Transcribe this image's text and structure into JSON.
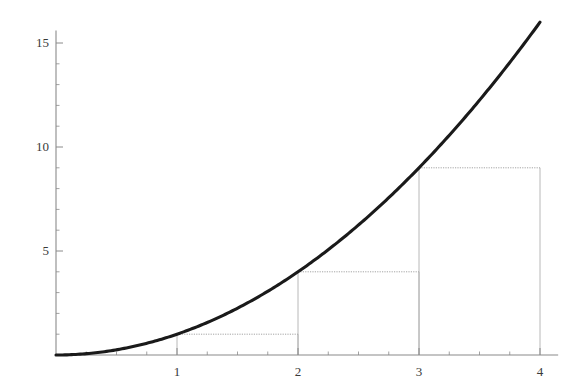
{
  "chart_data": {
    "type": "line",
    "title": "",
    "subtitle": "",
    "xlabel": "",
    "ylabel": "",
    "function": "y = x^2",
    "xlim": [
      0,
      4.15
    ],
    "ylim": [
      0,
      15.6
    ],
    "grid": false,
    "legend": null,
    "x_ticks_major": [
      1,
      2,
      3,
      4
    ],
    "x_tick_labels": [
      "1",
      "2",
      "3",
      "4"
    ],
    "x_ticks_minor_step": 0.25,
    "y_ticks_major": [
      5,
      10,
      15
    ],
    "y_tick_labels": [
      "5",
      "10",
      "15"
    ],
    "y_ticks_minor_step": 1,
    "series": [
      {
        "name": "y = x^2",
        "x": [
          0,
          0.2,
          0.4,
          0.6,
          0.8,
          1,
          1.2,
          1.4,
          1.6,
          1.8,
          2,
          2.2,
          2.4,
          2.6,
          2.8,
          3,
          3.2,
          3.4,
          3.6,
          3.8,
          4
        ],
        "values": [
          0,
          0.04,
          0.16,
          0.36,
          0.64,
          1,
          1.44,
          1.96,
          2.56,
          3.24,
          4,
          4.84,
          5.76,
          6.76,
          7.84,
          9,
          10.24,
          11.56,
          12.96,
          14.44,
          16
        ]
      }
    ],
    "rectangles": {
      "method": "left-endpoint Riemann sum",
      "width": 1,
      "items": [
        {
          "x0": 1,
          "x1": 2,
          "height": 1
        },
        {
          "x0": 2,
          "x1": 3,
          "height": 4
        },
        {
          "x0": 3,
          "x1": 4,
          "height": 9
        }
      ]
    },
    "colors": {
      "curve": "#1a1a1a",
      "axis": "#8a8a8a",
      "rectangle": "#b0b0b0",
      "rectangle_top": "#9a9a9a",
      "label": "#3a3a3a",
      "background": "#ffffff"
    }
  },
  "axes_labels": {
    "x": [
      "1",
      "2",
      "3",
      "4"
    ],
    "y": [
      "5",
      "10",
      "15"
    ]
  }
}
